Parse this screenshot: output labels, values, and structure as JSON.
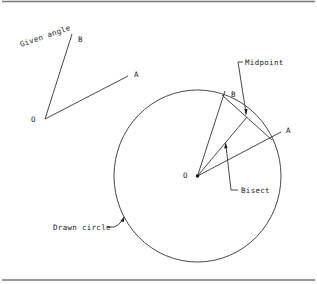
{
  "diagram": {
    "given_angle": {
      "caption": "Given angle",
      "vertex_label": "O",
      "ray_b_label": "B",
      "ray_a_label": "A"
    },
    "construction": {
      "center_label": "O",
      "point_b_label": "B",
      "point_a_label": "A",
      "midpoint_label": "Midpoint",
      "bisect_label": "Bisect",
      "circle_label": "Drawn circle"
    },
    "colors": {
      "line": "#333333",
      "rule": "#777777",
      "background": "#ffffff"
    }
  }
}
